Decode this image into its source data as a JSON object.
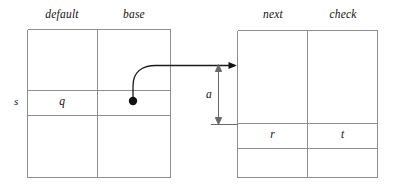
{
  "diagram": {
    "background_color": "#ffffff",
    "line_color": "#8d8d8d",
    "ink_color": "#111111"
  },
  "left_table": {
    "headers": [
      {
        "label": "default",
        "name": "column-header-default"
      },
      {
        "label": "base",
        "name": "column-header-base"
      }
    ],
    "row_label": "s",
    "cells": [
      {
        "label": "q",
        "name": "cell-q"
      },
      {
        "label": "",
        "name": "cell-base-source"
      }
    ]
  },
  "right_table": {
    "headers": [
      {
        "label": "next",
        "name": "column-header-next"
      },
      {
        "label": "check",
        "name": "column-header-check"
      }
    ],
    "cells": [
      {
        "label": "r",
        "name": "cell-r"
      },
      {
        "label": "t",
        "name": "cell-t"
      }
    ]
  },
  "annotations": {
    "offset_label": "a"
  }
}
